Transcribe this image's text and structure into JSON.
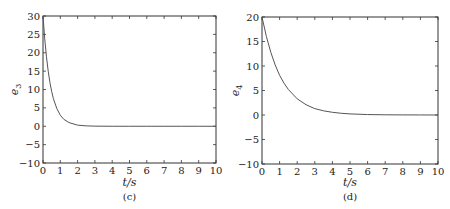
{
  "chart_data": [
    {
      "type": "line",
      "panel": "c",
      "caption": "(c)",
      "xlabel": "t/s",
      "ylabel": "e3",
      "ylabel_main": "e",
      "ylabel_sub": "3",
      "xlim": [
        0,
        10
      ],
      "ylim": [
        -10,
        30
      ],
      "xticks": [
        0,
        1,
        2,
        3,
        4,
        5,
        6,
        7,
        8,
        9,
        10
      ],
      "yticks": [
        -10,
        -5,
        0,
        5,
        10,
        15,
        20,
        25,
        30
      ],
      "ytick_labels": [
        "−10",
        "−5",
        "0",
        "5",
        "10",
        "15",
        "20",
        "25",
        "30"
      ],
      "grid": false,
      "series": [
        {
          "name": "e3",
          "x": [
            0,
            0.1,
            0.2,
            0.3,
            0.4,
            0.5,
            0.6,
            0.8,
            1.0,
            1.2,
            1.5,
            2.0,
            2.5,
            3.0,
            4.0,
            5.0,
            6.0,
            7.0,
            8.0,
            9.0,
            10.0
          ],
          "values": [
            30,
            23.8,
            18.9,
            15.0,
            11.9,
            9.5,
            7.5,
            4.8,
            3.0,
            1.9,
            1.0,
            0.3,
            0.1,
            0.03,
            0,
            0,
            0,
            0,
            0,
            0,
            0
          ]
        }
      ]
    },
    {
      "type": "line",
      "panel": "d",
      "caption": "(d)",
      "xlabel": "t/s",
      "ylabel": "e4",
      "ylabel_main": "e",
      "ylabel_sub": "4",
      "xlim": [
        0,
        10
      ],
      "ylim": [
        -10,
        20
      ],
      "xticks": [
        0,
        1,
        2,
        3,
        4,
        5,
        6,
        7,
        8,
        9,
        10
      ],
      "yticks": [
        -10,
        -5,
        0,
        5,
        10,
        15,
        20
      ],
      "ytick_labels": [
        "−10",
        "−5",
        "0",
        "5",
        "10",
        "15",
        "20"
      ],
      "grid": false,
      "series": [
        {
          "name": "e4",
          "x": [
            0,
            0.25,
            0.5,
            0.75,
            1.0,
            1.25,
            1.5,
            2.0,
            2.5,
            3.0,
            3.5,
            4.0,
            4.5,
            5.0,
            6.0,
            7.0,
            8.0,
            9.0,
            10.0
          ],
          "values": [
            20,
            16.0,
            12.8,
            10.2,
            8.1,
            6.5,
            5.2,
            3.3,
            2.1,
            1.3,
            0.85,
            0.55,
            0.35,
            0.22,
            0.09,
            0.04,
            0.02,
            0.01,
            0
          ]
        }
      ]
    }
  ],
  "colors": {
    "axis": "#333333",
    "line": "#555555",
    "background": "#ffffff"
  }
}
